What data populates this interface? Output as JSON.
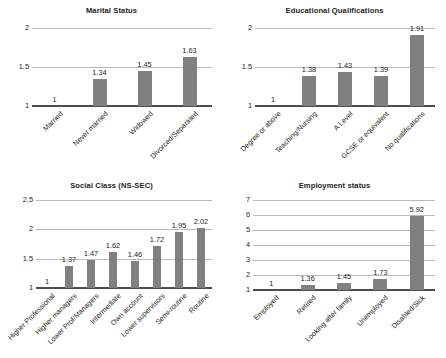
{
  "page": {
    "width": 446,
    "height": 358,
    "background_color": "#ffffff",
    "bar_color": "#808080",
    "gridline_color": "#b9b9b9",
    "axis_color": "#4d4d4d",
    "text_color": "#231f20"
  },
  "charts": [
    {
      "id": "marital-status",
      "title": "Marital Status",
      "type": "bar",
      "categories": [
        "Married",
        "Never married",
        "Widowed",
        "Divorced/Separated"
      ],
      "values": [
        1,
        1.34,
        1.45,
        1.63
      ],
      "value_labels": [
        "1",
        "1.34",
        "1.45",
        "1.63"
      ],
      "yticks": [
        1,
        1.5,
        2
      ],
      "ytick_labels": [
        "1",
        "1.5",
        "2"
      ],
      "ylim": [
        1,
        2
      ],
      "xlabel": "",
      "ylabel": "",
      "grid": true,
      "legend": "none"
    },
    {
      "id": "educational-qualifications",
      "title": "Educational Qualifications",
      "type": "bar",
      "categories": [
        "Degree or above",
        "Teaching/Nursing",
        "A Level",
        "GCSE or equivalent",
        "No qualifications"
      ],
      "values": [
        1,
        1.38,
        1.43,
        1.39,
        1.91
      ],
      "value_labels": [
        "1",
        "1.38",
        "1.43",
        "1.39",
        "1.91"
      ],
      "yticks": [
        1,
        1.5,
        2
      ],
      "ytick_labels": [
        "1",
        "1.5",
        "2"
      ],
      "ylim": [
        1,
        2
      ],
      "xlabel": "",
      "ylabel": "",
      "grid": true,
      "legend": "none"
    },
    {
      "id": "social-class",
      "title": "Social Class (NS-SEC)",
      "type": "bar",
      "categories": [
        "Higher Professional",
        "Higher managers",
        "Lower Prof/Managers",
        "Intermediate",
        "Own account",
        "Lower supervisors",
        "Semi-routine",
        "Routine"
      ],
      "values": [
        1,
        1.37,
        1.47,
        1.62,
        1.46,
        1.72,
        1.95,
        2.02
      ],
      "value_labels": [
        "1",
        "1.37",
        "1.47",
        "1.62",
        "1.46",
        "1.72",
        "1.95",
        "2.02"
      ],
      "yticks": [
        1,
        1.5,
        2,
        2.5
      ],
      "ytick_labels": [
        "1",
        "1.5",
        "2",
        "2.5"
      ],
      "ylim": [
        1,
        2.5
      ],
      "xlabel": "",
      "ylabel": "",
      "grid": true,
      "legend": "none"
    },
    {
      "id": "employment-status",
      "title": "Employment status",
      "type": "bar",
      "categories": [
        "Employed",
        "Retired",
        "Looking after family",
        "Unemployed",
        "Disabled/Sick"
      ],
      "values": [
        1,
        1.36,
        1.45,
        1.73,
        5.92
      ],
      "value_labels": [
        "1",
        "1.36",
        "1.45",
        "1.73",
        "5.92"
      ],
      "yticks": [
        1,
        2,
        3,
        4,
        5,
        6,
        7
      ],
      "ytick_labels": [
        "1",
        "2",
        "3",
        "4",
        "5",
        "6",
        "7"
      ],
      "ylim": [
        1,
        7
      ],
      "xlabel": "",
      "ylabel": "",
      "grid": true,
      "legend": "none"
    }
  ],
  "chart_data": [
    {
      "type": "bar",
      "title": "Marital Status",
      "categories": [
        "Married",
        "Never married",
        "Widowed",
        "Divorced/Separated"
      ],
      "values": [
        1,
        1.34,
        1.45,
        1.63
      ],
      "xlabel": "",
      "ylabel": "",
      "ylim": [
        1,
        2
      ],
      "yticks": [
        1,
        1.5,
        2
      ],
      "grid": true,
      "legend_position": "none"
    },
    {
      "type": "bar",
      "title": "Educational Qualifications",
      "categories": [
        "Degree or above",
        "Teaching/Nursing",
        "A Level",
        "GCSE or equivalent",
        "No qualifications"
      ],
      "values": [
        1,
        1.38,
        1.43,
        1.39,
        1.91
      ],
      "xlabel": "",
      "ylabel": "",
      "ylim": [
        1,
        2
      ],
      "yticks": [
        1,
        1.5,
        2
      ],
      "grid": true,
      "legend_position": "none"
    },
    {
      "type": "bar",
      "title": "Social Class (NS-SEC)",
      "categories": [
        "Higher Professional",
        "Higher managers",
        "Lower Prof/Managers",
        "Intermediate",
        "Own account",
        "Lower supervisors",
        "Semi-routine",
        "Routine"
      ],
      "values": [
        1,
        1.37,
        1.47,
        1.62,
        1.46,
        1.72,
        1.95,
        2.02
      ],
      "xlabel": "",
      "ylabel": "",
      "ylim": [
        1,
        2.5
      ],
      "yticks": [
        1,
        1.5,
        2,
        2.5
      ],
      "grid": true,
      "legend_position": "none"
    },
    {
      "type": "bar",
      "title": "Employment status",
      "categories": [
        "Employed",
        "Retired",
        "Looking after family",
        "Unemployed",
        "Disabled/Sick"
      ],
      "values": [
        1,
        1.36,
        1.45,
        1.73,
        5.92
      ],
      "xlabel": "",
      "ylabel": "",
      "ylim": [
        1,
        7
      ],
      "yticks": [
        1,
        2,
        3,
        4,
        5,
        6,
        7
      ],
      "grid": true,
      "legend_position": "none"
    }
  ]
}
